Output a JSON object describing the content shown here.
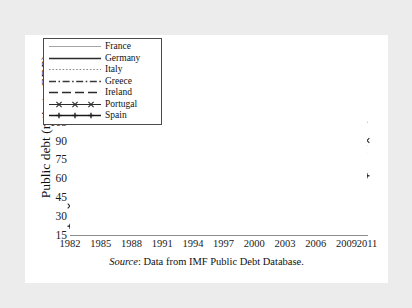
{
  "figure": {
    "caption_source_label": "Source",
    "caption_text": ": Data from IMF Public Debt Database."
  },
  "chart_data": {
    "type": "line",
    "title": "",
    "xlabel": "",
    "ylabel": "Public debt (ratio to GDP)",
    "xlim": [
      1982,
      2011
    ],
    "ylim": [
      15,
      165
    ],
    "ytick_values": [
      165,
      150,
      135,
      120,
      105,
      90,
      75,
      60,
      45,
      30,
      15
    ],
    "xtick_values": [
      "1982",
      "1985",
      "1988",
      "1991",
      "1994",
      "1997",
      "2000",
      "2003",
      "2006",
      "2009",
      "2011"
    ],
    "grid": false,
    "legend_position": "top-left",
    "x": [
      1982,
      1983,
      1984,
      1985,
      1986,
      1987,
      1988,
      1989,
      1990,
      1991,
      1992,
      1993,
      1994,
      1995,
      1996,
      1997,
      1998,
      1999,
      2000,
      2001,
      2002,
      2003,
      2004,
      2005,
      2006,
      2007,
      2008,
      2009,
      2010,
      2011
    ],
    "series": [
      {
        "name": "France",
        "style": "solid-thin",
        "color": "#9a9a9a",
        "values": [
          25,
          26,
          27,
          28,
          29,
          29,
          29,
          29,
          30,
          32,
          35,
          41,
          45,
          47,
          50,
          53,
          54,
          55,
          55,
          55,
          57,
          60,
          62,
          62,
          60,
          60,
          64,
          73,
          78,
          86
        ]
      },
      {
        "name": "Germany",
        "style": "solid",
        "color": "#2b2b2b",
        "values": [
          37,
          39,
          40,
          41,
          40,
          41,
          41,
          40,
          40,
          38,
          41,
          45,
          48,
          53,
          57,
          58,
          59,
          60,
          58,
          57,
          59,
          63,
          64,
          67,
          66,
          64,
          66,
          74,
          82,
          80
        ]
      },
      {
        "name": "Italy",
        "style": "dotted",
        "color": "#8a8a8a",
        "values": [
          62,
          70,
          75,
          80,
          85,
          87,
          88,
          92,
          94,
          98,
          105,
          115,
          120,
          122,
          121,
          118,
          115,
          113,
          109,
          108,
          105,
          104,
          104,
          106,
          106,
          103,
          106,
          116,
          119,
          121
        ]
      },
      {
        "name": "Greece",
        "style": "dash-dot",
        "color": "#3a3a3a",
        "values": [
          63,
          68,
          73,
          75,
          76,
          78,
          79,
          80,
          90,
          92,
          94,
          99,
          98,
          98,
          100,
          97,
          96,
          97,
          104,
          104,
          102,
          98,
          99,
          101,
          104,
          105,
          110,
          127,
          145,
          152
        ]
      },
      {
        "name": "Ireland",
        "style": "long-dash",
        "color": "#2b2b2b",
        "values": [
          null,
          null,
          null,
          null,
          null,
          78,
          76,
          75,
          93,
          87,
          88,
          87,
          80,
          null,
          null,
          null,
          null,
          null,
          38,
          35,
          32,
          31,
          29,
          27,
          25,
          24,
          44,
          65,
          92,
          105
        ]
      },
      {
        "name": "Portugal",
        "style": "marker-x",
        "color": "#2b2b2b",
        "values": [
          38,
          43,
          48,
          55,
          54,
          52,
          51,
          52,
          53,
          52,
          46,
          52,
          57,
          58,
          57,
          55,
          52,
          50,
          48,
          47,
          53,
          55,
          57,
          62,
          63,
          67,
          71,
          83,
          93,
          90
        ]
      },
      {
        "name": "Spain",
        "style": "marker-plus",
        "color": "#1a1a1a",
        "values": [
          22,
          28,
          33,
          39,
          42,
          40,
          39,
          39,
          40,
          40,
          44,
          56,
          58,
          62,
          66,
          64,
          62,
          60,
          57,
          52,
          48,
          46,
          44,
          42,
          38,
          34,
          39,
          52,
          60,
          62
        ]
      }
    ]
  },
  "legend": {
    "items": [
      {
        "label": "France",
        "swatch": "line-solid-thin-gray"
      },
      {
        "label": "Germany",
        "swatch": "line-solid-dark"
      },
      {
        "label": "Italy",
        "swatch": "line-dotted"
      },
      {
        "label": "Greece",
        "swatch": "line-dash-dot"
      },
      {
        "label": "Ireland",
        "swatch": "line-long-dash"
      },
      {
        "label": "Portugal",
        "swatch": "line-marker-x"
      },
      {
        "label": "Spain",
        "swatch": "line-marker-plus"
      }
    ]
  }
}
